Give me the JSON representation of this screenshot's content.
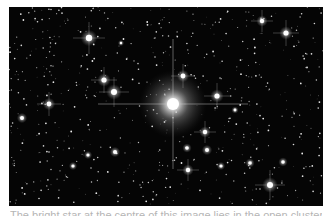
{
  "image": {
    "subject": "star cluster field",
    "background_color": "#050505",
    "central_star": {
      "x": 164,
      "y": 97,
      "halo_radius": 34
    },
    "bright_stars": [
      {
        "x": 80,
        "y": 31,
        "r": 3.2
      },
      {
        "x": 105,
        "y": 85,
        "r": 3.0
      },
      {
        "x": 95,
        "y": 73,
        "r": 2.6
      },
      {
        "x": 40,
        "y": 97,
        "r": 2.4
      },
      {
        "x": 13,
        "y": 111,
        "r": 2.0
      },
      {
        "x": 253,
        "y": 14,
        "r": 2.2
      },
      {
        "x": 277,
        "y": 26,
        "r": 2.6
      },
      {
        "x": 174,
        "y": 69,
        "r": 2.4
      },
      {
        "x": 208,
        "y": 89,
        "r": 2.6
      },
      {
        "x": 196,
        "y": 125,
        "r": 2.2
      },
      {
        "x": 178,
        "y": 141,
        "r": 1.8
      },
      {
        "x": 198,
        "y": 143,
        "r": 2.0
      },
      {
        "x": 179,
        "y": 163,
        "r": 2.2
      },
      {
        "x": 261,
        "y": 178,
        "r": 3.0
      },
      {
        "x": 241,
        "y": 156,
        "r": 1.8
      },
      {
        "x": 274,
        "y": 155,
        "r": 1.8
      },
      {
        "x": 212,
        "y": 159,
        "r": 1.6
      },
      {
        "x": 106,
        "y": 145,
        "r": 2.0
      },
      {
        "x": 79,
        "y": 148,
        "r": 1.6
      },
      {
        "x": 64,
        "y": 159,
        "r": 1.6
      },
      {
        "x": 226,
        "y": 103,
        "r": 1.4
      },
      {
        "x": 112,
        "y": 36,
        "r": 1.2
      }
    ]
  },
  "caption": {
    "text": "The bright star at the centre of this image lies in the open cluster NGC 3603. The ..."
  }
}
